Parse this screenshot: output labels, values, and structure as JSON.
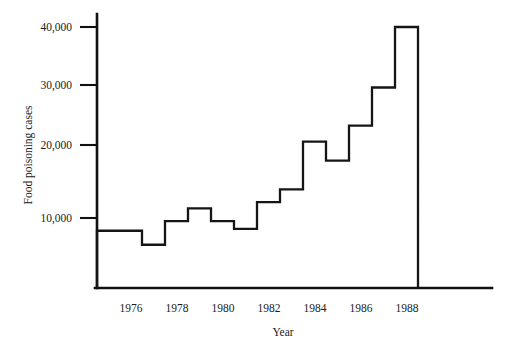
{
  "chart_data": {
    "type": "line",
    "subtype": "step",
    "title": "",
    "xlabel": "Year",
    "ylabel": "Food poisoning cases",
    "x": [
      1975,
      1976,
      1977,
      1978,
      1979,
      1980,
      1981,
      1982,
      1983,
      1984,
      1985,
      1986,
      1987,
      1988
    ],
    "values": [
      8000,
      8000,
      5800,
      9500,
      11500,
      9500,
      8300,
      12500,
      14500,
      22000,
      19000,
      24500,
      30500,
      40000
    ],
    "categories": [
      "1975",
      "1976",
      "1977",
      "1978",
      "1979",
      "1980",
      "1981",
      "1982",
      "1983",
      "1984",
      "1985",
      "1986",
      "1987",
      "1988"
    ],
    "xlim": [
      1975,
      1989
    ],
    "ylim": [
      0,
      42000
    ],
    "xticks": [
      1976,
      1978,
      1980,
      1982,
      1984,
      1986,
      1988
    ],
    "xticklabels": [
      "1976",
      "1978",
      "1980",
      "1982",
      "1984",
      "1986",
      "1988"
    ],
    "yticks": [
      10000,
      20000,
      30000,
      40000
    ],
    "yticklabels": [
      "10,000",
      "20,000",
      "30,000",
      "40,000"
    ],
    "grid": false,
    "legend": null,
    "line_color": "#151515",
    "axis_color": "#111111",
    "background": "#ffffff"
  },
  "axis": {
    "y_label": "Food poisoning cases",
    "x_label": "Year",
    "y_ticks": [
      {
        "label": "40,000",
        "value": 40000
      },
      {
        "label": "30,000",
        "value": 30000
      },
      {
        "label": "20,000",
        "value": 20000
      },
      {
        "label": "10,000",
        "value": 10000
      }
    ],
    "x_ticks": [
      {
        "label": "1976",
        "value": 1976
      },
      {
        "label": "1978",
        "value": 1978
      },
      {
        "label": "1980",
        "value": 1980
      },
      {
        "label": "1982",
        "value": 1982
      },
      {
        "label": "1984",
        "value": 1984
      },
      {
        "label": "1986",
        "value": 1986
      },
      {
        "label": "1988",
        "value": 1988
      }
    ]
  }
}
